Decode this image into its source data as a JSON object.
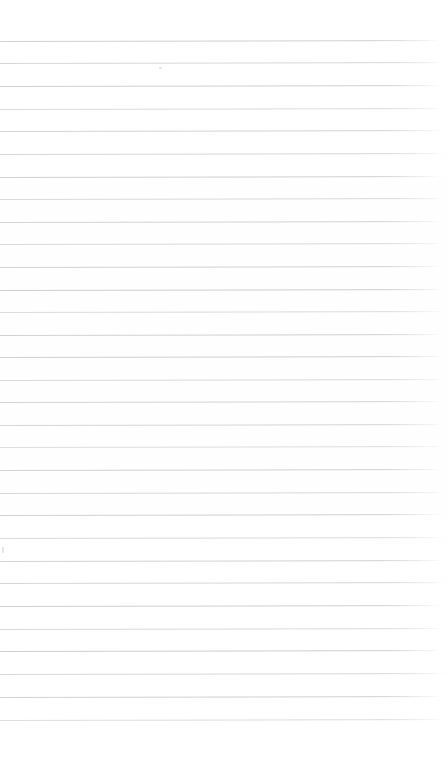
{
  "document": {
    "kind": "scanned-ruled-paper",
    "title": "Blank ruled notebook page",
    "page_width": 448,
    "page_height": 781,
    "background_color": "#ffffff",
    "content_text": "",
    "has_visible_text": false,
    "has_handwriting": false
  },
  "ruling": {
    "line_color": "#c9c9cf",
    "line_thickness_px": 1,
    "line_spacing_px": 22.6,
    "first_line_y": 41,
    "last_line_y": 720,
    "line_count": 31,
    "left_margin_x": 0,
    "right_end_x": 444,
    "skew_degrees": -0.12,
    "top_margin_px": 41,
    "bottom_margin_px": 61,
    "lines": [
      {
        "y": 41,
        "opacity": 0.85,
        "end_x": 440
      },
      {
        "y": 63,
        "opacity": 0.72,
        "end_x": 446
      },
      {
        "y": 86,
        "opacity": 0.88,
        "end_x": 441
      },
      {
        "y": 109,
        "opacity": 0.66,
        "end_x": 445
      },
      {
        "y": 131,
        "opacity": 0.8,
        "end_x": 443
      },
      {
        "y": 154,
        "opacity": 0.74,
        "end_x": 444
      },
      {
        "y": 177,
        "opacity": 0.86,
        "end_x": 440
      },
      {
        "y": 199,
        "opacity": 0.7,
        "end_x": 446
      },
      {
        "y": 222,
        "opacity": 0.82,
        "end_x": 442
      },
      {
        "y": 244,
        "opacity": 0.68,
        "end_x": 445
      },
      {
        "y": 267,
        "opacity": 0.84,
        "end_x": 441
      },
      {
        "y": 290,
        "opacity": 0.9,
        "end_x": 444
      },
      {
        "y": 312,
        "opacity": 0.64,
        "end_x": 446
      },
      {
        "y": 335,
        "opacity": 0.86,
        "end_x": 442
      },
      {
        "y": 357,
        "opacity": 0.88,
        "end_x": 444
      },
      {
        "y": 380,
        "opacity": 0.7,
        "end_x": 445
      },
      {
        "y": 402,
        "opacity": 0.8,
        "end_x": 441
      },
      {
        "y": 425,
        "opacity": 0.76,
        "end_x": 444
      },
      {
        "y": 447,
        "opacity": 0.62,
        "end_x": 446
      },
      {
        "y": 470,
        "opacity": 0.84,
        "end_x": 442
      },
      {
        "y": 493,
        "opacity": 0.72,
        "end_x": 445
      },
      {
        "y": 515,
        "opacity": 0.86,
        "end_x": 441
      },
      {
        "y": 538,
        "opacity": 0.66,
        "end_x": 444
      },
      {
        "y": 561,
        "opacity": 0.82,
        "end_x": 443
      },
      {
        "y": 583,
        "opacity": 0.74,
        "end_x": 446
      },
      {
        "y": 606,
        "opacity": 0.88,
        "end_x": 440
      },
      {
        "y": 629,
        "opacity": 0.68,
        "end_x": 445
      },
      {
        "y": 651,
        "opacity": 0.9,
        "end_x": 442
      },
      {
        "y": 674,
        "opacity": 0.7,
        "end_x": 446
      },
      {
        "y": 697,
        "opacity": 0.84,
        "end_x": 441
      },
      {
        "y": 720,
        "opacity": 0.62,
        "end_x": 444
      }
    ]
  },
  "artifacts": [
    {
      "name": "scan-speck-left",
      "x": 2,
      "y": 547,
      "width": 2,
      "height": 6
    },
    {
      "name": "scan-speck-top",
      "x": 159,
      "y": 67,
      "width": 3,
      "height": 2
    }
  ]
}
